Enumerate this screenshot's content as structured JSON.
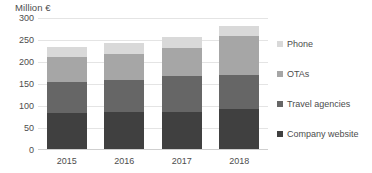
{
  "chart_data": {
    "type": "bar",
    "stacked": true,
    "title": "",
    "axis_unit_title": "Million €",
    "xlabel": "",
    "ylabel": "Million €",
    "categories": [
      "2015",
      "2016",
      "2017",
      "2018"
    ],
    "ylim": [
      0,
      300
    ],
    "yticks": [
      300,
      250,
      200,
      150,
      100,
      50,
      0
    ],
    "ytick_labels": [
      "300",
      "250",
      "200",
      "150",
      "100",
      "50",
      "0"
    ],
    "grid": true,
    "grid_axis": "y",
    "legend_position": "right",
    "series": [
      {
        "name": "Company website",
        "color": "#404040",
        "values": [
          82,
          85,
          85,
          90
        ]
      },
      {
        "name": "Travel agencies",
        "color": "#666666",
        "values": [
          70,
          72,
          80,
          78
        ]
      },
      {
        "name": "OTAs",
        "color": "#a6a6a6",
        "values": [
          58,
          60,
          65,
          90
        ]
      },
      {
        "name": "Phone",
        "color": "#d9d9d9",
        "values": [
          22,
          23,
          25,
          22
        ]
      }
    ],
    "stack_totals": [
      232,
      240,
      255,
      280
    ]
  },
  "legend": {
    "items": [
      {
        "label": "Phone",
        "color": "#d9d9d9"
      },
      {
        "label": "OTAs",
        "color": "#a6a6a6"
      },
      {
        "label": "Travel agencies",
        "color": "#666666"
      },
      {
        "label": "Company website",
        "color": "#404040"
      }
    ]
  },
  "colors": {
    "background": "#ffffff",
    "text": "#4d4d4d",
    "gridline": "#e4e4e4",
    "axis": "#cfcfcf"
  }
}
